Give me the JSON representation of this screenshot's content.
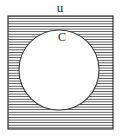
{
  "figure": {
    "type": "venn-set-diagram",
    "background_color": "#ffffff",
    "width": 120,
    "height": 136
  },
  "universe": {
    "label": "u",
    "label_x": 60,
    "label_y": 12,
    "rect": {
      "x": 8,
      "y": 16,
      "width": 105,
      "height": 113
    },
    "border_color": "#333333",
    "border_width": 1,
    "fill_pattern": "horizontal-hatch",
    "hatch_color": "#4d4d4d",
    "hatch_spacing": 2.6,
    "hatch_line_width": 0.9
  },
  "set": {
    "label": "C",
    "label_x": 62,
    "label_y": 41,
    "circle": {
      "cx": 59,
      "cy": 70,
      "r": 40
    },
    "fill_color": "#ffffff",
    "stroke_color": "#3a3a3a",
    "stroke_width": 1
  },
  "shaded_region": {
    "name": "complement-of-C",
    "notation": "C'",
    "shaded": true
  }
}
